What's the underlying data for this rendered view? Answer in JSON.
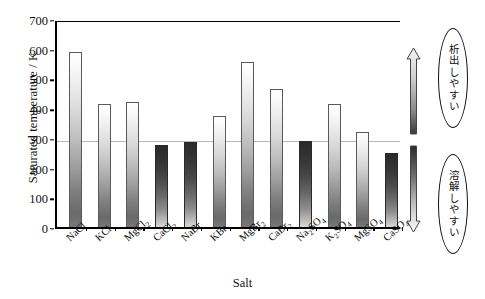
{
  "chart_data": {
    "type": "bar",
    "title": "",
    "xlabel": "Salt",
    "ylabel": "Saturated temperature / K",
    "ylim": [
      0,
      700
    ],
    "yticks": [
      0,
      100,
      200,
      300,
      400,
      500,
      600,
      700
    ],
    "grid": false,
    "reference_line": 300,
    "legend": "none",
    "categories": [
      "NaCl",
      "KCl",
      "MgCl2",
      "CaCl2",
      "NaBr",
      "KBr",
      "MgBr2",
      "CaBr2",
      "Na2SO4",
      "K2SO4",
      "MgSO4",
      "CaSO4"
    ],
    "category_labels_html": [
      "NaCl",
      "KCl",
      "MgCl<sub>2</sub>",
      "CaCl<sub>2</sub>",
      "NaBr",
      "KBr",
      "MgBr<sub>2</sub>",
      "CaBr<sub>2</sub>",
      "Na<sub>2</sub>SO<sub>4</sub>",
      "K<sub>2</sub>SO<sub>4</sub>",
      "MgSO<sub>4</sub>",
      "CaSO<sub>4</sub>"
    ],
    "values": [
      590,
      413,
      420,
      275,
      285,
      375,
      555,
      465,
      290,
      413,
      320,
      250
    ],
    "bar_styles": [
      "light",
      "light",
      "light",
      "dark",
      "dark",
      "light",
      "light",
      "light",
      "dark",
      "light",
      "light",
      "dark"
    ]
  },
  "axis": {
    "y_title": "Saturated temperature / K",
    "x_title": "Salt",
    "y_tick_labels": [
      "700",
      "600",
      "500",
      "400",
      "300",
      "200",
      "100",
      "0"
    ]
  },
  "annotations": {
    "upper": {
      "text": "析出しやすい",
      "arrow": "arrow-up"
    },
    "lower": {
      "text": "溶解しやすい",
      "arrow": "arrow-down"
    }
  },
  "colors": {
    "axis": "#000000",
    "reference_line": "#b9b9b9",
    "bar_light_top": "#ffffff",
    "bar_light_bottom": "#6a6a6a",
    "bar_dark_top": "#2a2a2a",
    "bar_dark_bottom": "#d9d9d9",
    "background": "#ffffff"
  }
}
